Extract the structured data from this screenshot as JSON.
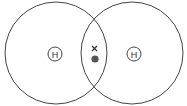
{
  "diagram": {
    "atoms": [
      {
        "symbol": "H",
        "cx": 56,
        "cy": 53,
        "shell_r": 52
      },
      {
        "symbol": "H",
        "cx": 134,
        "cy": 53,
        "shell_r": 52
      }
    ],
    "shared_electrons": [
      {
        "type": "cross",
        "x": 94,
        "y": 49
      },
      {
        "type": "dot",
        "x": 95,
        "y": 59
      }
    ],
    "colors": {
      "line": "#444444",
      "dot": "#555555"
    }
  }
}
